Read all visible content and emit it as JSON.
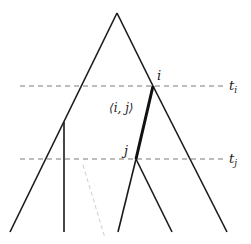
{
  "diagram": {
    "labels": {
      "node_i": "i",
      "node_j": "j",
      "edge_ij": "⟨i, j⟩",
      "time_i": "t",
      "time_i_sub": "i",
      "time_j": "t",
      "time_j_sub": "j"
    },
    "colors": {
      "line": "#1a1a1a",
      "dashed": "#7a7a7a",
      "dotted": "#cccccc"
    }
  }
}
